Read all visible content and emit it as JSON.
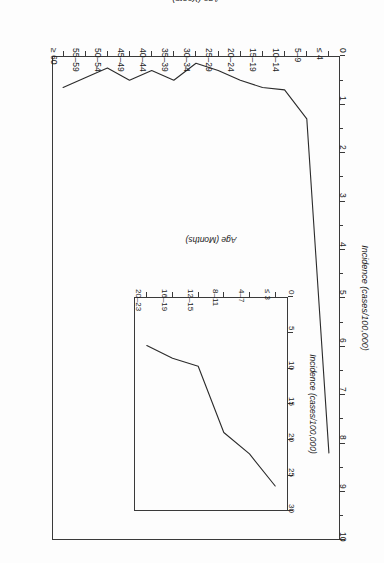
{
  "figure": {
    "orientation": "rotated-180",
    "background_color": "#fdfdfd",
    "line_color": "#2b2b2b",
    "axis_color": "#3a3a3a"
  },
  "main_plot": {
    "xlabel": "Age (Years)",
    "ylabel": "Incidence (cases/100,000)",
    "x_tick_labels": [
      "≤ 4",
      "5–9",
      "10–14",
      "15–19",
      "20–24",
      "25–29",
      "30–34",
      "35–39",
      "40–44",
      "45–49",
      "50–54",
      "55–59",
      "≥ 60"
    ],
    "y_tick_labels": [
      "0",
      "1",
      "2",
      "3",
      "4",
      "5",
      "6",
      "7",
      "8",
      "9",
      "10"
    ]
  },
  "inset_plot": {
    "xlabel": "Age (Months)",
    "ylabel": "Incidence (cases/100,000)",
    "x_tick_labels": [
      "≤ 3",
      "4–7",
      "8–11",
      "12–15",
      "16–19",
      "20–23"
    ],
    "y_tick_labels": [
      "0",
      "5",
      "10",
      "15",
      "20",
      "25",
      "30"
    ]
  },
  "chart_data": [
    {
      "type": "line",
      "id": "main",
      "title": "",
      "xlabel": "Age (Years)",
      "ylabel": "Incidence (cases/100,000)",
      "categories": [
        "≤ 4",
        "5–9",
        "10–14",
        "15–19",
        "20–24",
        "25–29",
        "30–34",
        "35–39",
        "40–44",
        "45–49",
        "50–54",
        "55–59",
        "≥ 60"
      ],
      "values": [
        8.2,
        1.3,
        0.7,
        0.65,
        0.5,
        0.3,
        0.15,
        0.5,
        0.3,
        0.5,
        0.25,
        0.45,
        0.65
      ],
      "ylim": [
        0,
        10
      ],
      "y_ticks": [
        0,
        1,
        2,
        3,
        4,
        5,
        6,
        7,
        8,
        9,
        10
      ],
      "grid": false,
      "legend": "none"
    },
    {
      "type": "line",
      "id": "inset",
      "title": "",
      "xlabel": "Age (Months)",
      "ylabel": "Incidence (cases/100,000)",
      "categories": [
        "≤ 3",
        "4–7",
        "8–11",
        "12–15",
        "16–19",
        "20–23"
      ],
      "values": [
        26.5,
        22.0,
        19.0,
        9.7,
        8.6,
        6.8
      ],
      "ylim": [
        0,
        30
      ],
      "y_ticks": [
        0,
        5,
        10,
        15,
        20,
        25,
        30
      ],
      "grid": false,
      "legend": "none"
    }
  ]
}
